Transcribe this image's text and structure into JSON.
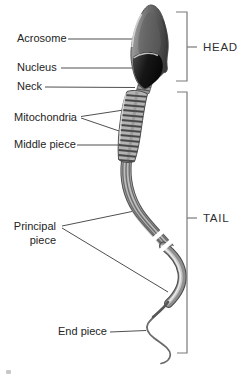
{
  "labels": {
    "acrosome": "Acrosome",
    "nucleus": "Nucleus",
    "neck": "Neck",
    "mitochondria": "Mitochondria",
    "middle_piece": "Middle piece",
    "principal_line1": "Principal",
    "principal_line2": "piece",
    "end_piece": "End piece",
    "head": "HEAD",
    "tail": "TAIL"
  },
  "colors": {
    "background": "#ffffff",
    "label_text": "#242424",
    "leader_line": "#4f4f4f",
    "bracket": "#7a7a7a",
    "head_dark": "#151515",
    "midpiece_gray": "#b3b3b3",
    "tail_gray": "#6e6e6e"
  }
}
